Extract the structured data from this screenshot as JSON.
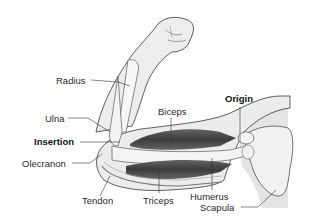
{
  "diagram": {
    "labels": {
      "radius": "Radius",
      "ulna": "Ulna",
      "insertion": "Insertion",
      "olecranon": "Olecranon",
      "tendon": "Tendon",
      "triceps": "Triceps",
      "biceps": "Biceps",
      "origin": "Origin",
      "humerus": "Humerus",
      "scapula": "Scapula"
    },
    "emphasized_labels": [
      "Insertion",
      "Origin"
    ],
    "colors": {
      "skin": "#ececec",
      "outline": "#555555",
      "muscle": "#4a4a4a",
      "bone": "#f2f2f2",
      "shoulder_panel": "#e6e6e6",
      "text": "#2a2a2a"
    }
  }
}
